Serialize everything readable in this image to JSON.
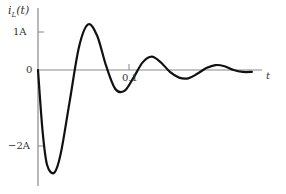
{
  "chart_data": {
    "type": "line",
    "title": "",
    "ylabel": "i_L(t)",
    "xlabel": "t",
    "y_ticks": [
      "1A",
      "0",
      "−2A"
    ],
    "x_ticks": [
      "0.1"
    ],
    "grid": false,
    "legend": null,
    "series": [
      {
        "name": "i_L(t)",
        "x": [
          0,
          0.005,
          0.01,
          0.018,
          0.025,
          0.035,
          0.045,
          0.055,
          0.065,
          0.075,
          0.085,
          0.095,
          0.105,
          0.115,
          0.125,
          0.135,
          0.145,
          0.155,
          0.165,
          0.175,
          0.185,
          0.195,
          0.205,
          0.215,
          0.225,
          0.235
        ],
        "values": [
          0,
          -1.6,
          -2.5,
          -2.7,
          -2.2,
          -0.8,
          0.6,
          1.2,
          0.9,
          0.1,
          -0.5,
          -0.55,
          -0.2,
          0.2,
          0.35,
          0.2,
          -0.05,
          -0.2,
          -0.22,
          -0.1,
          0.05,
          0.13,
          0.1,
          0.0,
          -0.05,
          -0.05
        ]
      }
    ],
    "xlim": [
      0,
      0.24
    ],
    "ylim": [
      -3,
      1.7
    ]
  },
  "labels": {
    "y_axis": "i",
    "y_sub": "L",
    "y_arg": "(t)",
    "tick_1A": "1A",
    "tick_0": "0",
    "tick_m2A": "−2A",
    "tick_01": "0.1",
    "x_axis": "t"
  }
}
